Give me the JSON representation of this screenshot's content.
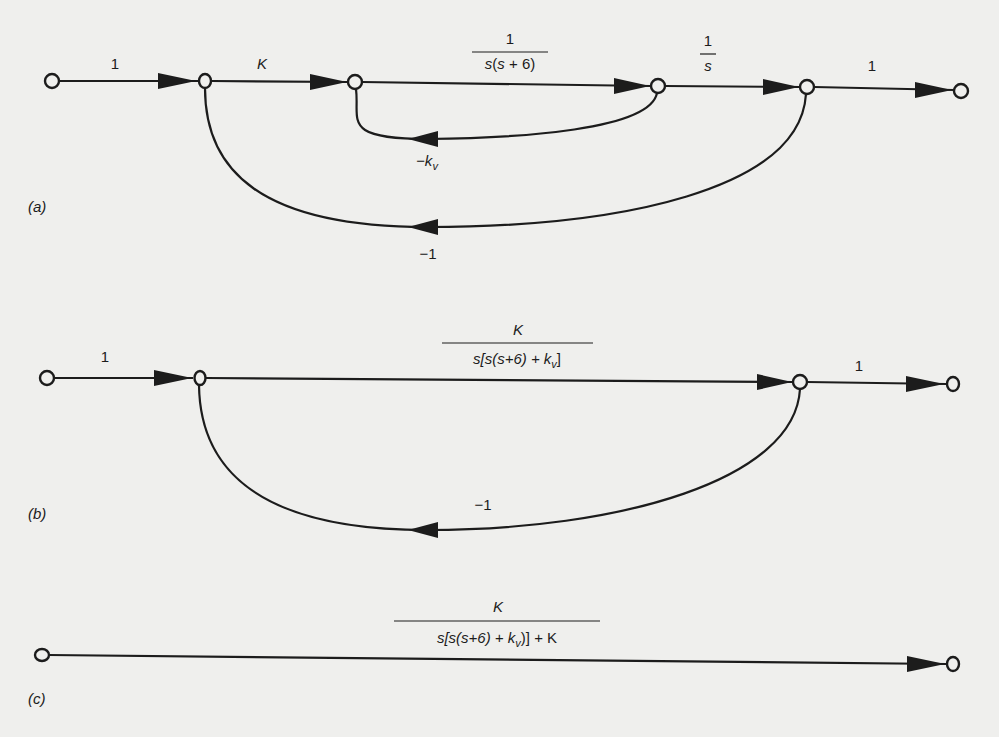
{
  "figure": {
    "panels": [
      {
        "id": "a",
        "label": "(a)",
        "nodes": 6,
        "forward_gains": [
          {
            "num": "1",
            "den": ""
          },
          {
            "num": "K",
            "den": ""
          },
          {
            "num": "1",
            "den": "s(s+6)"
          },
          {
            "num": "1",
            "den": "s"
          },
          {
            "num": "1",
            "den": ""
          }
        ],
        "feedback_gains": [
          {
            "text_main": "−k",
            "text_sub": "v",
            "from_node": 3,
            "to_node": 2
          },
          {
            "text_main": "−1",
            "text_sub": "",
            "from_node": 4,
            "to_node": 1
          }
        ]
      },
      {
        "id": "b",
        "label": "(b)",
        "nodes": 4,
        "forward_gains": [
          {
            "num": "1",
            "den": ""
          },
          {
            "num": "K",
            "den_pre": "s[s(s+6) + k",
            "den_sub": "v",
            "den_post": "]"
          },
          {
            "num": "1",
            "den": ""
          }
        ],
        "feedback_gains": [
          {
            "text_main": "−1",
            "text_sub": "",
            "from_node": 2,
            "to_node": 1
          }
        ]
      },
      {
        "id": "c",
        "label": "(c)",
        "nodes": 2,
        "forward_gains": [
          {
            "num": "K",
            "den_pre": "s[s(s+6) + k",
            "den_sub": "v",
            "den_post": ")] + K"
          }
        ]
      }
    ],
    "colors": {
      "background": "#efefed",
      "ink": "#1c1c1c"
    }
  }
}
